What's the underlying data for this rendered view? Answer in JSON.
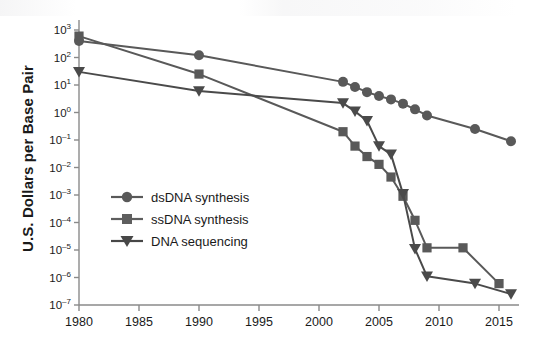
{
  "chart_data": {
    "type": "line",
    "title": "",
    "xlabel": "",
    "ylabel": "U.S. Dollars per Base Pair",
    "xlim": [
      1979,
      2017
    ],
    "ylim": [
      1e-07,
      1000
    ],
    "yscale": "log",
    "grid": false,
    "legend_position": "center-left",
    "xticks": [
      1980,
      1985,
      1990,
      1995,
      2000,
      2005,
      2010,
      2015
    ],
    "yticks": [
      1000,
      100,
      10,
      1,
      0.1,
      0.01,
      0.001,
      0.0001,
      1e-05,
      1e-06,
      1e-07
    ],
    "ytick_labels": [
      "10^3",
      "10^2",
      "10^1",
      "10^0",
      "10^-1",
      "10^-2",
      "10^-3",
      "10^-4",
      "10^-5",
      "10^-6",
      "10^-7"
    ],
    "ytick_mantissa": [
      "10",
      "10",
      "10",
      "10",
      "10",
      "10",
      "10",
      "10",
      "10",
      "10",
      "10"
    ],
    "ytick_exponent": [
      "3",
      "2",
      "1",
      "0",
      "-1",
      "-2",
      "-3",
      "-4",
      "-5",
      "-6",
      "-7"
    ],
    "series": [
      {
        "name": "dsDNA synthesis",
        "marker": "circle",
        "color": "#595959",
        "points": [
          {
            "x": 1980,
            "y": 400
          },
          {
            "x": 1990,
            "y": 120
          },
          {
            "x": 2002,
            "y": 13
          },
          {
            "x": 2003,
            "y": 8.5
          },
          {
            "x": 2004,
            "y": 5.5
          },
          {
            "x": 2005,
            "y": 4.0
          },
          {
            "x": 2006,
            "y": 3.0
          },
          {
            "x": 2007,
            "y": 2.1
          },
          {
            "x": 2008,
            "y": 1.3
          },
          {
            "x": 2009,
            "y": 0.78
          },
          {
            "x": 2013,
            "y": 0.25
          },
          {
            "x": 2016,
            "y": 0.09
          }
        ]
      },
      {
        "name": "ssDNA synthesis",
        "marker": "square",
        "color": "#595959",
        "points": [
          {
            "x": 1980,
            "y": 600
          },
          {
            "x": 1990,
            "y": 25
          },
          {
            "x": 2002,
            "y": 0.2
          },
          {
            "x": 2003,
            "y": 0.06
          },
          {
            "x": 2004,
            "y": 0.025
          },
          {
            "x": 2005,
            "y": 0.013
          },
          {
            "x": 2006,
            "y": 0.0045
          },
          {
            "x": 2007,
            "y": 0.0009
          },
          {
            "x": 2008,
            "y": 0.00012
          },
          {
            "x": 2009,
            "y": 1.2e-05
          },
          {
            "x": 2012,
            "y": 1.2e-05
          },
          {
            "x": 2015,
            "y": 6e-07
          }
        ]
      },
      {
        "name": "DNA sequencing",
        "marker": "triangle",
        "color": "#4a4a4a",
        "points": [
          {
            "x": 1980,
            "y": 30
          },
          {
            "x": 1990,
            "y": 6
          },
          {
            "x": 2002,
            "y": 2.2
          },
          {
            "x": 2003,
            "y": 1.1
          },
          {
            "x": 2004,
            "y": 0.5
          },
          {
            "x": 2005,
            "y": 0.06
          },
          {
            "x": 2006,
            "y": 0.03
          },
          {
            "x": 2007,
            "y": 0.0011
          },
          {
            "x": 2008,
            "y": 1.1e-05
          },
          {
            "x": 2009,
            "y": 1.1e-06
          },
          {
            "x": 2013,
            "y": 6e-07
          },
          {
            "x": 2016,
            "y": 2.5e-07
          }
        ]
      }
    ]
  },
  "legend": {
    "items": [
      {
        "label": "dsDNA synthesis",
        "marker": "circle"
      },
      {
        "label": "ssDNA synthesis",
        "marker": "square"
      },
      {
        "label": "DNA sequencing",
        "marker": "triangle"
      }
    ]
  },
  "axis": {
    "y_title": "U.S. Dollars per Base Pair"
  },
  "colors": {
    "circle": "#595959",
    "square": "#5e5e5e",
    "triangle": "#474747",
    "axis": "#8a8a8a",
    "text": "#1a1a1a"
  }
}
